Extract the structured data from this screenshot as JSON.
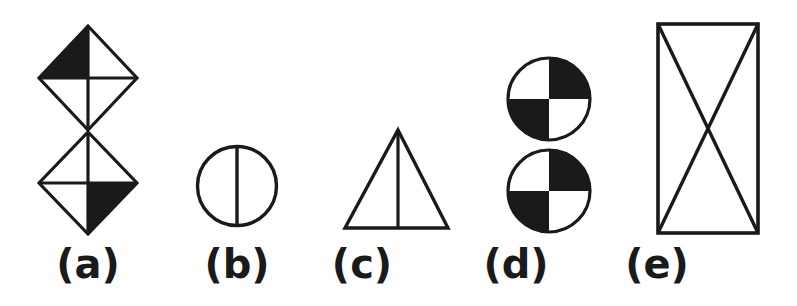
{
  "figure": {
    "background_color": "#ffffff",
    "ink_color": "#1a1a1a",
    "stroke_width": 3.2,
    "caption_font_size": 40,
    "items": [
      {
        "key": "a",
        "label": "(a)",
        "shape_name": "stacked-bowtie-diamonds",
        "description": "Two quartered diamonds stacked vertically, touching at their tips; upper diamond's upper-left quadrant filled, lower diamond's lower-right quadrant filled.",
        "label_x": 88,
        "label_y": 278,
        "geometry": {
          "top_diamond": {
            "cx": 88,
            "cy": 78,
            "rx": 49,
            "ry": 52
          },
          "bottom_diamond": {
            "cx": 88,
            "cy": 183,
            "rx": 49,
            "ry": 51
          },
          "filled_quadrants": [
            "top-diamond-upper-left",
            "bottom-diamond-lower-right"
          ]
        }
      },
      {
        "key": "b",
        "label": "(b)",
        "shape_name": "circle-with-vertical-diameter",
        "description": "Outline circle bisected by a vertical diameter line.",
        "label_x": 237,
        "label_y": 278,
        "geometry": {
          "cx": 237,
          "cy": 186,
          "r": 41
        }
      },
      {
        "key": "c",
        "label": "(c)",
        "shape_name": "triangle-with-median",
        "description": "Isosceles triangle with a vertical line from the apex to the middle of the base.",
        "label_x": 362,
        "label_y": 278,
        "geometry": {
          "apex_x": 398,
          "apex_y": 130,
          "base_left_x": 345,
          "base_right_x": 448,
          "base_y": 228
        }
      },
      {
        "key": "d",
        "label": "(d)",
        "shape_name": "stacked-checkered-circles",
        "description": "Two circles stacked vertically and touching; each quartered in a checkerboard pattern with the upper-right and lower-left quadrants filled.",
        "label_x": 516,
        "label_y": 278,
        "geometry": {
          "top_circle": {
            "cx": 549,
            "cy": 99,
            "r": 41
          },
          "bottom_circle": {
            "cx": 549,
            "cy": 191,
            "r": 41
          },
          "filled_quadrants": [
            "upper-right",
            "lower-left"
          ]
        }
      },
      {
        "key": "e",
        "label": "(e)",
        "shape_name": "rectangle-with-diagonals",
        "description": "Tall outline rectangle with both diagonals drawn, forming an X.",
        "label_x": 657,
        "label_y": 278,
        "geometry": {
          "x": 658,
          "y": 24,
          "width": 100,
          "height": 209
        }
      }
    ]
  }
}
